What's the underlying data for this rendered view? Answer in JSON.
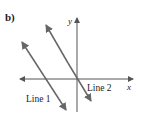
{
  "figure": {
    "part_label": "b)",
    "axes": {
      "x_label": "x",
      "y_label": "y"
    },
    "lines": [
      {
        "name": "Line 1",
        "label": "Line 1"
      },
      {
        "name": "Line 2",
        "label": "Line 2"
      }
    ],
    "colors": {
      "axis": "#555555",
      "line": "#666666",
      "text": "#222222"
    }
  }
}
